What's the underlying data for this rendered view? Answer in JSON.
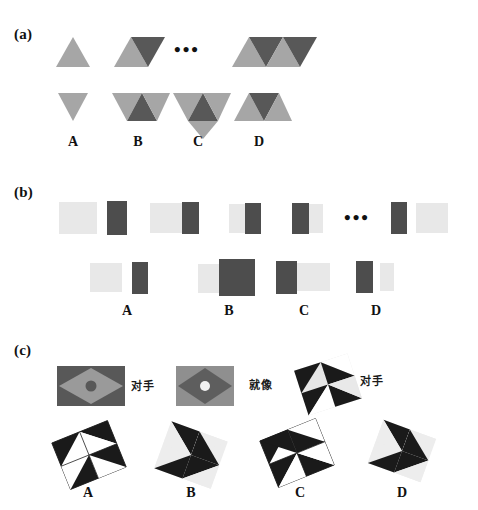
{
  "figure": {
    "width": 478,
    "height": 510,
    "background": "#ffffff"
  },
  "colors": {
    "light_gray": "#a6a6a6",
    "mid_gray": "#8c8c8c",
    "dark_gray": "#585858",
    "rect_light": "#e8e8e8",
    "rect_dark": "#4d4d4d",
    "black": "#1a1a1a",
    "white": "#ffffff",
    "pale": "#e6e6e6",
    "text": "#111111"
  },
  "panels": [
    {
      "id": "a",
      "label": "(a)",
      "description": "triangle-strip sequence puzzle",
      "sequence": [
        {
          "name": "term-1",
          "triangles": [
            {
              "dir": "up",
              "tone": "light"
            }
          ]
        },
        {
          "name": "term-2",
          "triangles": [
            {
              "dir": "up",
              "tone": "light"
            },
            {
              "dir": "down",
              "tone": "dark"
            }
          ]
        },
        {
          "name": "ellipsis",
          "text": "•••"
        },
        {
          "name": "term-n",
          "triangles": [
            {
              "dir": "up",
              "tone": "light"
            },
            {
              "dir": "down",
              "tone": "dark"
            },
            {
              "dir": "up",
              "tone": "light"
            },
            {
              "dir": "down",
              "tone": "dark"
            }
          ]
        }
      ],
      "options": [
        {
          "label": "A",
          "triangles": [
            {
              "dir": "down",
              "tone": "light"
            }
          ]
        },
        {
          "label": "B",
          "triangles": [
            {
              "dir": "down",
              "tone": "light"
            },
            {
              "dir": "up",
              "tone": "dark"
            },
            {
              "dir": "down",
              "tone": "light"
            }
          ]
        },
        {
          "label": "C",
          "triangles": [
            {
              "dir": "down",
              "tone": "light"
            },
            {
              "dir": "up",
              "tone": "dark"
            },
            {
              "dir": "down",
              "tone": "light"
            },
            {
              "dir": "down-big",
              "tone": "light"
            }
          ]
        },
        {
          "label": "D",
          "triangles": [
            {
              "dir": "up",
              "tone": "light"
            },
            {
              "dir": "down",
              "tone": "dark"
            },
            {
              "dir": "up",
              "tone": "light"
            }
          ]
        }
      ]
    },
    {
      "id": "b",
      "label": "(b)",
      "description": "light/dark rectangle pair sequence puzzle",
      "sequence": [
        {
          "name": "term-1",
          "blocks": [
            {
              "tone": "light",
              "w": 38,
              "h": 34
            },
            {
              "tone": "dark",
              "w": 20,
              "h": 34
            }
          ]
        },
        {
          "name": "term-2",
          "blocks": [
            {
              "tone": "light",
              "w": 32,
              "h": 31
            },
            {
              "tone": "dark",
              "w": 17,
              "h": 31
            }
          ]
        },
        {
          "name": "term-3",
          "blocks": [
            {
              "tone": "light",
              "w": 16,
              "h": 30
            },
            {
              "tone": "dark",
              "w": 16,
              "h": 30
            }
          ]
        },
        {
          "name": "term-4",
          "blocks": [
            {
              "tone": "dark",
              "w": 17,
              "h": 30
            },
            {
              "tone": "light",
              "w": 14,
              "h": 30
            }
          ]
        },
        {
          "name": "ellipsis",
          "text": "•••"
        },
        {
          "name": "term-n",
          "blocks": [
            {
              "tone": "dark",
              "w": 16,
              "h": 31
            },
            {
              "tone": "light",
              "w": 32,
              "h": 31
            }
          ]
        }
      ],
      "options": [
        {
          "label": "A",
          "blocks": [
            {
              "tone": "light",
              "w": 32,
              "h": 30
            },
            {
              "tone": "dark",
              "w": 16,
              "h": 30
            }
          ],
          "gap": 9
        },
        {
          "label": "B",
          "blocks": [
            {
              "tone": "light",
              "w": 20,
              "h": 30
            },
            {
              "tone": "dark",
              "w": 33,
              "h": 36
            }
          ],
          "gap": 0
        },
        {
          "label": "C",
          "blocks": [
            {
              "tone": "dark",
              "w": 20,
              "h": 32
            },
            {
              "tone": "light",
              "w": 32,
              "h": 28
            }
          ],
          "gap": 0
        },
        {
          "label": "D",
          "blocks": [
            {
              "tone": "dark",
              "w": 17,
              "h": 31
            },
            {
              "tone": "light",
              "w": 14,
              "h": 28
            }
          ],
          "gap": 6
        }
      ]
    },
    {
      "id": "c",
      "label": "(c)",
      "description": "rhombus and pinwheel transformation puzzle",
      "prompt": [
        {
          "name": "shape-1",
          "kind": "rhombus-in-rect",
          "fill_outer": "#585858",
          "fill_inner": "#8c8c8c",
          "dot": "#585858"
        },
        {
          "name": "relation-1",
          "text": "对手"
        },
        {
          "name": "shape-2",
          "kind": "rhombus-in-rect",
          "fill_outer": "#8c8c8c",
          "fill_inner": "#585858",
          "dot": "#ffffff"
        },
        {
          "name": "relation-2",
          "text": "就像"
        },
        {
          "name": "shape-3",
          "kind": "pinwheel",
          "tilt": 0
        },
        {
          "name": "relation-3",
          "text": "对手"
        }
      ],
      "options": [
        {
          "label": "A",
          "kind": "pinwheel",
          "rotate": -22
        },
        {
          "label": "B",
          "kind": "pinwheel",
          "rotate": 20
        },
        {
          "label": "C",
          "kind": "pinwheel",
          "rotate": -22
        },
        {
          "label": "D",
          "kind": "pinwheel",
          "rotate": 20
        }
      ]
    }
  ]
}
